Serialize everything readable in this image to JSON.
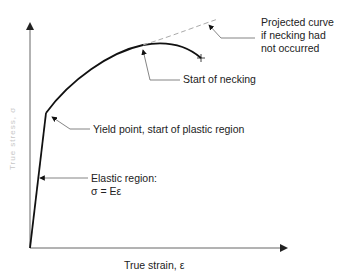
{
  "diagram": {
    "x_axis_label": "True strain, ε",
    "y_axis_label": "True stress, σ",
    "annotations": {
      "projected_curve": [
        "Projected curve",
        "if necking had",
        "not occurred"
      ],
      "start_of_necking": "Start of necking",
      "yield_point": "Yield point, start of plastic region",
      "elastic_region_line1": "Elastic region:",
      "elastic_region_line2": "σ = Eε"
    },
    "colors": {
      "curve": "#1a1a1a",
      "axes": "#555555",
      "projected": "#aaaaaa",
      "leader": "#666666"
    }
  }
}
